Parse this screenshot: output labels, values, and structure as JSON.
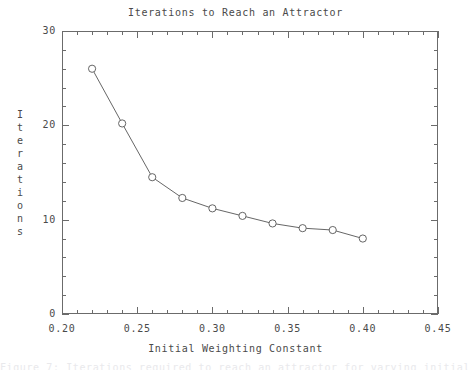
{
  "chart_data": {
    "type": "line",
    "title": "Iterations to Reach an Attractor",
    "xlabel": "Initial Weighting Constant",
    "ylabel": "Iterations",
    "xlim": [
      0.2,
      0.45
    ],
    "ylim": [
      0,
      30
    ],
    "grid": false,
    "legend": null,
    "marker": "open-circle",
    "line_color": "#555555",
    "marker_color": "#555555",
    "background_color": "#ffffff",
    "axis_color": "#6b6b6b",
    "x_major_ticks": [
      0.2,
      0.25,
      0.3,
      0.35,
      0.4,
      0.45
    ],
    "x_major_tick_labels": [
      "0.20",
      "0.25",
      "0.30",
      "0.35",
      "0.40",
      "0.45"
    ],
    "x_minor_tick_step": 0.01,
    "y_major_ticks": [
      0,
      10,
      20,
      30
    ],
    "y_major_tick_labels": [
      "0",
      "10",
      "20",
      "30"
    ],
    "y_minor_tick_step": 2,
    "x": [
      0.22,
      0.24,
      0.26,
      0.28,
      0.3,
      0.32,
      0.34,
      0.36,
      0.38,
      0.4
    ],
    "values": [
      26.0,
      20.2,
      14.5,
      12.3,
      11.2,
      10.4,
      9.6,
      9.1,
      8.9,
      8.0
    ],
    "series": [
      {
        "name": "Iterations to attractor",
        "x": [
          0.22,
          0.24,
          0.26,
          0.28,
          0.3,
          0.32,
          0.34,
          0.36,
          0.38,
          0.4
        ],
        "values": [
          26.0,
          20.2,
          14.5,
          12.3,
          11.2,
          10.4,
          9.6,
          9.1,
          8.9,
          8.0
        ]
      }
    ]
  },
  "figure": {
    "bottom_caption": "Figure 7: Iterations required to reach an attractor for varying initial weights"
  }
}
